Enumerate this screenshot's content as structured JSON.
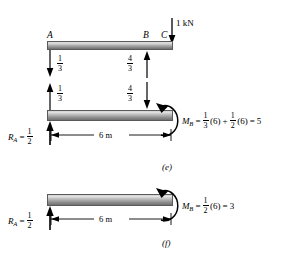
{
  "figure": {
    "units": "kN, m"
  },
  "panels": [
    {
      "tag": "(e)",
      "beam_top": {
        "points": [
          {
            "name": "A",
            "label": "A"
          },
          {
            "name": "B",
            "label": "B"
          },
          {
            "name": "C",
            "label": "C"
          }
        ],
        "applied_load": {
          "label": "1 kN",
          "direction": "down"
        },
        "reactions": [
          {
            "at": "A",
            "numerator": "1",
            "denominator": "3",
            "direction": "down"
          },
          {
            "at": "B",
            "numerator": "4",
            "denominator": "3",
            "direction": "up"
          }
        ]
      },
      "beam_bottom": {
        "reactions": [
          {
            "at": "A",
            "numerator": "1",
            "denominator": "3",
            "direction": "up"
          },
          {
            "at": "B",
            "numerator": "4",
            "denominator": "3",
            "direction": "down"
          }
        ],
        "support_reaction": {
          "symbol": "R",
          "subscript": "A",
          "equals": "=",
          "numerator": "1",
          "denominator": "2"
        },
        "span": {
          "label": "6 m"
        },
        "moment": {
          "symbol": "M",
          "subscript": "B",
          "equals": "=",
          "terms": [
            {
              "numerator": "1",
              "denominator": "3",
              "factor": "(6)"
            },
            {
              "operator": "+",
              "numerator": "1",
              "denominator": "2",
              "factor": "(6)"
            }
          ],
          "result_operator": "=",
          "result": "5",
          "arc_direction": "counterclockwise"
        }
      }
    },
    {
      "tag": "(f)",
      "beam": {
        "support_reaction": {
          "symbol": "R",
          "subscript": "A",
          "equals": "=",
          "numerator": "1",
          "denominator": "2"
        },
        "span": {
          "label": "6 m"
        },
        "moment": {
          "symbol": "M",
          "subscript": "B",
          "equals": "=",
          "terms": [
            {
              "numerator": "1",
              "denominator": "2",
              "factor": "(6)"
            }
          ],
          "result_operator": "=",
          "result": "3",
          "arc_direction": "counterclockwise"
        }
      }
    }
  ],
  "colors": {
    "ink": "#000000",
    "beam_light": "#e3e3e3",
    "beam_dark": "#707070",
    "background": "#ffffff"
  }
}
